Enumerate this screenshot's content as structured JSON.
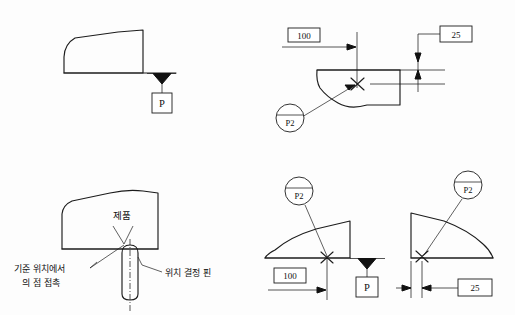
{
  "figure": {
    "background_color": "#fdfdfd",
    "line_color": "#1c1c1c"
  },
  "quadrants": {
    "top_left": {
      "name": "free-workpiece-on-support",
      "symbols": {
        "support_datum": {
          "icon": "filled-triangle-support-icon",
          "box_label": "P"
        }
      }
    },
    "top_right": {
      "name": "workpiece-with-dimensions",
      "dimensions": [
        {
          "label": "100",
          "orientation": "horizontal"
        },
        {
          "label": "25",
          "orientation": "vertical"
        }
      ],
      "balloons": [
        {
          "label": "P2",
          "icon": "datum-balloon-icon"
        }
      ],
      "contact_mark": "x-contact-point-icon"
    },
    "bottom_left": {
      "name": "workpiece-on-locating-pin",
      "labels": {
        "product": "제품",
        "datum_contact_line1": "기준 위치에서",
        "datum_contact_line2": "의 점 접촉",
        "locating_pin": "위치 결정 핀"
      }
    },
    "bottom_right": {
      "name": "rotated-workpiece-variants",
      "left_view": {
        "balloon": "P2",
        "dimension": "100",
        "support_datum_box": "P",
        "support_icon": "filled-triangle-support-icon",
        "contact_mark": "x-contact-point-icon"
      },
      "right_view": {
        "balloon": "P2",
        "dimension": "25",
        "contact_mark": "x-contact-point-icon"
      }
    }
  }
}
